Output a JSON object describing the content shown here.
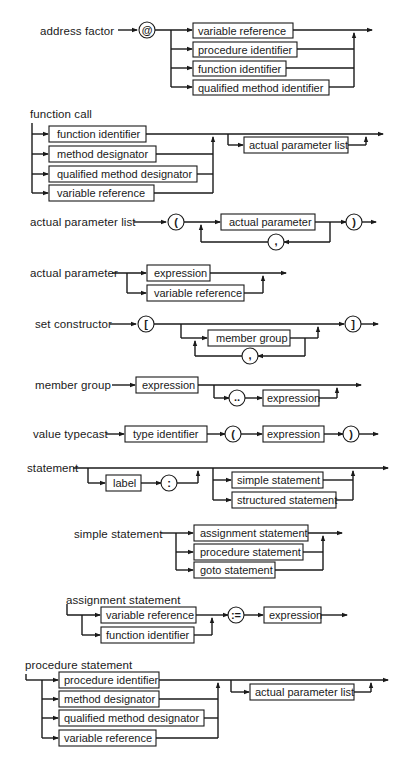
{
  "diagrams": {
    "address_factor": {
      "title": "address factor",
      "symbol": "@",
      "options": [
        "variable reference",
        "procedure identifier",
        "function identifier",
        "qualified method identifier"
      ]
    },
    "function_call": {
      "title": "function call",
      "options": [
        "function identifier",
        "method designator",
        "qualified method designator",
        "variable reference"
      ],
      "optional": "actual parameter list"
    },
    "actual_parameter_list": {
      "title": "actual parameter list",
      "open": "(",
      "item": "actual parameter",
      "separator": ",",
      "close": ")"
    },
    "actual_parameter": {
      "title": "actual parameter",
      "options": [
        "expression",
        "variable reference"
      ]
    },
    "set_constructor": {
      "title": "set constructor",
      "open": "[",
      "item": "member group",
      "separator": ",",
      "close": "]"
    },
    "member_group": {
      "title": "member group",
      "first": "expression",
      "range": "..",
      "second": "expression"
    },
    "value_typecast": {
      "title": "value typecast",
      "type": "type identifier",
      "open": "(",
      "expr": "expression",
      "close": ")"
    },
    "statement": {
      "title": "statement",
      "label": "label",
      "colon": ":",
      "options": [
        "simple statement",
        "structured statement"
      ]
    },
    "simple_statement": {
      "title": "simple statement",
      "options": [
        "assignment statement",
        "procedure statement",
        "goto statement"
      ]
    },
    "assignment_statement": {
      "title": "assignment statement",
      "options": [
        "variable reference",
        "function identifier"
      ],
      "assign": ":=",
      "expr": "expression"
    },
    "procedure_statement": {
      "title": "procedure statement",
      "options": [
        "procedure identifier",
        "method designator",
        "qualified method designator",
        "variable reference"
      ],
      "optional": "actual parameter list"
    }
  }
}
